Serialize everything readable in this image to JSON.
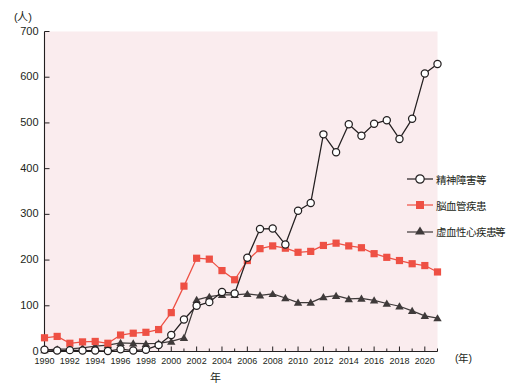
{
  "chart_data": {
    "type": "line",
    "title": "",
    "xlabel": "年",
    "ylabel": "(人)",
    "y_unit_label": "(人)",
    "x_unit_label": "(年)",
    "xlim": [
      1990,
      2021
    ],
    "ylim": [
      0,
      700
    ],
    "y_ticks": [
      0,
      100,
      200,
      300,
      400,
      500,
      600,
      700
    ],
    "x_ticks": [
      1990,
      1992,
      1994,
      1996,
      1998,
      2000,
      2002,
      2004,
      2006,
      2008,
      2010,
      2012,
      2014,
      2016,
      2018,
      2020
    ],
    "x_tick_labels": [
      "1990",
      "1992",
      "1994",
      "1996",
      "1998",
      "2000",
      "2002",
      "2004",
      "2006",
      "2008",
      "2010",
      "2012",
      "2014",
      "2016",
      "2018",
      "2020"
    ],
    "grid": false,
    "legend_position": "right",
    "plot_background": "#faecee",
    "x": [
      1990,
      1991,
      1992,
      1993,
      1994,
      1995,
      1996,
      1997,
      1998,
      1999,
      2000,
      2001,
      2002,
      2003,
      2004,
      2005,
      2006,
      2007,
      2008,
      2009,
      2010,
      2011,
      2012,
      2013,
      2014,
      2015,
      2016,
      2017,
      2018,
      2019,
      2020,
      2021
    ],
    "series": [
      {
        "name": "精神障害等",
        "key": "mental",
        "color": "#231f20",
        "marker": "open-circle",
        "values": [
          4,
          2,
          3,
          2,
          2,
          1,
          5,
          2,
          4,
          14,
          36,
          70,
          100,
          108,
          130,
          127,
          205,
          268,
          269,
          234,
          308,
          325,
          475,
          436,
          497,
          472,
          498,
          506,
          465,
          509,
          608,
          629
        ]
      },
      {
        "name": "脳血管疾患",
        "key": "cerebro",
        "color": "#ee5044",
        "marker": "filled-square",
        "values": [
          30,
          33,
          18,
          21,
          22,
          18,
          36,
          40,
          42,
          48,
          85,
          143,
          204,
          202,
          177,
          157,
          199,
          225,
          231,
          226,
          217,
          219,
          232,
          237,
          231,
          227,
          214,
          206,
          199,
          192,
          188,
          174
        ]
      },
      {
        "name": "虚血性心疾患等",
        "key": "ischemic",
        "color": "#3f3a3a",
        "marker": "filled-triangle",
        "values": [
          3,
          5,
          6,
          8,
          12,
          14,
          19,
          18,
          17,
          18,
          22,
          30,
          113,
          120,
          124,
          124,
          126,
          123,
          126,
          117,
          107,
          107,
          119,
          122,
          115,
          116,
          112,
          105,
          99,
          89,
          78,
          73
        ]
      }
    ]
  },
  "legend": {
    "items": [
      {
        "label": "精神障害等",
        "marker": "open-circle",
        "color": "#231f20"
      },
      {
        "label": "脳血管疾患",
        "marker": "filled-square",
        "color": "#ee5044"
      },
      {
        "label": "虚血性心疾患等",
        "marker": "filled-triangle",
        "color": "#3f3a3a"
      }
    ]
  },
  "axes": {
    "y_unit": "(人)",
    "x_unit": "(年)",
    "x_title": "年"
  }
}
